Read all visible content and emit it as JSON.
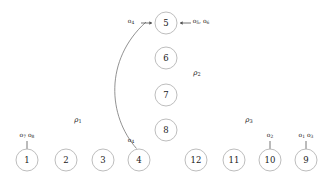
{
  "diagram": {
    "type": "state-transition-graph",
    "background_color": "#ffffff",
    "node_stroke_color": "#b5b5b5",
    "edge_color": "#6e6e6e",
    "arrow_color": "#4a4a4a",
    "text_color": "#1a1a1a",
    "nodes": [
      {
        "id": "n1",
        "label": "1",
        "cx": 27,
        "cy": 160,
        "r": 11
      },
      {
        "id": "n2",
        "label": "2",
        "cx": 66,
        "cy": 160,
        "r": 11
      },
      {
        "id": "n3",
        "label": "3",
        "cx": 103,
        "cy": 160,
        "r": 11
      },
      {
        "id": "n4",
        "label": "4",
        "cx": 139,
        "cy": 160,
        "r": 11
      },
      {
        "id": "n12",
        "label": "12",
        "cx": 196,
        "cy": 160,
        "r": 11
      },
      {
        "id": "n11",
        "label": "11",
        "cx": 234,
        "cy": 160,
        "r": 11
      },
      {
        "id": "n10",
        "label": "10",
        "cx": 270,
        "cy": 160,
        "r": 11
      },
      {
        "id": "n9",
        "label": "9",
        "cx": 306,
        "cy": 160,
        "r": 11
      },
      {
        "id": "n5",
        "label": "5",
        "cx": 166,
        "cy": 23,
        "r": 11
      },
      {
        "id": "n6",
        "label": "6",
        "cx": 166,
        "cy": 58,
        "r": 11
      },
      {
        "id": "n7",
        "label": "7",
        "cx": 166,
        "cy": 95,
        "r": 11
      },
      {
        "id": "n8",
        "label": "8",
        "cx": 166,
        "cy": 130,
        "r": 11
      }
    ],
    "edges": [
      {
        "id": "e4to5",
        "from": "n4",
        "to": "n5",
        "label_base": "o",
        "label_sub": "4",
        "path": "M 136.5 148.5 C 108 116, 104 60, 146 22"
      }
    ],
    "input_arrows": [
      {
        "id": "arrow-o4-into-5",
        "target": "n5",
        "direction": "right",
        "label_base": "o",
        "label_sub": "4",
        "label_x": 131,
        "label_y": 21,
        "x1": 141,
        "y1": 23,
        "x2": 152,
        "y2": 23
      },
      {
        "id": "arrow-o56-into-5",
        "target": "n5",
        "direction": "left",
        "label_text": "o5, o6",
        "label_base_1": "o",
        "label_sub_1": "5",
        "label_base_2": "o",
        "label_sub_2": "6",
        "label_x": 201,
        "label_y": 21,
        "x1": 191,
        "y1": 23,
        "x2": 180,
        "y2": 23
      },
      {
        "id": "arrow-o78-into-1",
        "target": "n1",
        "direction": "up",
        "label_base_1": "o",
        "label_sub_1": "7",
        "label_base_2": "o",
        "label_sub_2": "8",
        "label_x": 27,
        "label_y": 135,
        "x1": 27,
        "y1": 141,
        "x2": 27,
        "y2": 149
      },
      {
        "id": "arrow-o2-into-10",
        "target": "n10",
        "direction": "up",
        "label_base": "o",
        "label_sub": "2",
        "label_x": 270,
        "label_y": 135,
        "x1": 270,
        "y1": 141,
        "x2": 270,
        "y2": 149
      },
      {
        "id": "arrow-o13-into-9",
        "target": "n9",
        "direction": "up",
        "label_base_1": "o",
        "label_sub_1": "1",
        "label_base_2": "o",
        "label_sub_2": "3",
        "label_x": 306,
        "label_y": 135,
        "x1": 306,
        "y1": 141,
        "x2": 306,
        "y2": 149
      }
    ],
    "edge_labels": [
      {
        "id": "label-o4-at-4",
        "label_base": "o",
        "label_sub": "4",
        "x": 131,
        "y": 140
      }
    ],
    "region_labels": [
      {
        "id": "rho1",
        "base": "ρ",
        "sub": "1",
        "x": 78,
        "y": 120
      },
      {
        "id": "rho2",
        "base": "ρ",
        "sub": "2",
        "x": 197,
        "y": 73
      },
      {
        "id": "rho3",
        "base": "ρ",
        "sub": "3",
        "x": 249,
        "y": 120
      }
    ]
  }
}
